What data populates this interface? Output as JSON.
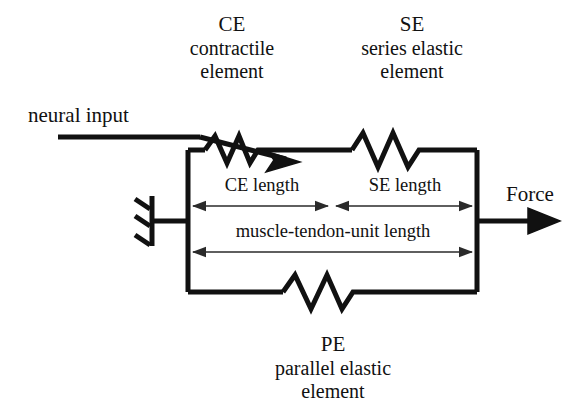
{
  "diagram": {
    "ink_color": "#111111",
    "thin_color": "#2a2a2a",
    "background": "#ffffff"
  },
  "labels": {
    "neural_input": "neural input",
    "force": "Force",
    "ce": {
      "abbrev": "CE",
      "line2": "contractile",
      "line3": "element"
    },
    "se": {
      "abbrev": "SE",
      "line2": "series elastic",
      "line3": "element"
    },
    "pe": {
      "abbrev": "PE",
      "line2": "parallel elastic",
      "line3": "element"
    },
    "ce_length": "CE length",
    "se_length": "SE length",
    "mtu_length": "muscle-tendon-unit length"
  },
  "elements": {
    "ground_symbol": "fixed-support",
    "ce_symbol": "spring-with-arrow",
    "se_symbol": "spring",
    "pe_symbol": "spring",
    "force_symbol": "arrow-right",
    "neural_symbol": "arrow-angled"
  }
}
